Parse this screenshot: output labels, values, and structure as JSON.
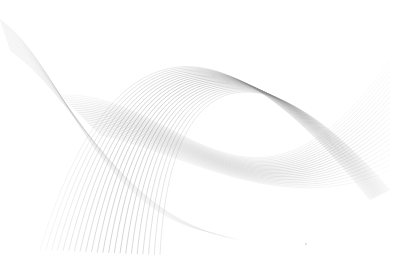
{
  "image": {
    "description": "Abstract gray line-wave pattern on white background",
    "width": 404,
    "height": 270,
    "background": "#ffffff",
    "line_color": "#8a8a8a",
    "line_color_light": "#cfcfcf"
  },
  "waves": {
    "family_a": {
      "count": 22,
      "opacity_max": 0.55
    },
    "family_b": {
      "count": 22,
      "opacity_max": 0.45
    },
    "family_c": {
      "count": 16,
      "opacity_max": 0.25
    }
  }
}
